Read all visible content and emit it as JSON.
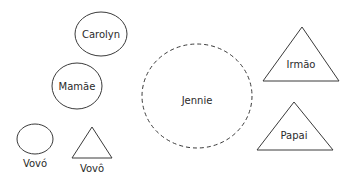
{
  "diagram": {
    "type": "family genogram",
    "nodes": [
      {
        "id": "carolyn",
        "label": "Carolyn",
        "shape": "ellipse",
        "style": "solid"
      },
      {
        "id": "mamae",
        "label": "Mamãe",
        "shape": "ellipse",
        "style": "solid"
      },
      {
        "id": "vovo_f",
        "label": "Vovó",
        "shape": "ellipse",
        "style": "solid"
      },
      {
        "id": "vovo_m",
        "label": "Vovô",
        "shape": "triangle",
        "style": "solid"
      },
      {
        "id": "jennie",
        "label": "Jennie",
        "shape": "circle",
        "style": "dashed"
      },
      {
        "id": "irmao",
        "label": "Irmão",
        "shape": "triangle",
        "style": "solid"
      },
      {
        "id": "papai",
        "label": "Papai",
        "shape": "triangle",
        "style": "solid"
      }
    ]
  },
  "colors": {
    "stroke": "#3a3a3a",
    "text": "#2a2a2a",
    "background": "#ffffff"
  }
}
